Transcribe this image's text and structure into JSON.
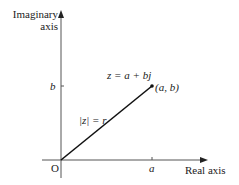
{
  "diagram": {
    "y_axis_label_line1": "Imaginary",
    "y_axis_label_line2": "axis",
    "x_axis_label": "Real axis",
    "origin_label": "O",
    "x_tick_label": "a",
    "y_tick_label": "b",
    "equation_label": "z = a + bj",
    "point_label": "(a, b)",
    "modulus_label": "|z| = r",
    "colors": {
      "axis": "#555555",
      "vector": "#111111",
      "text": "#222222"
    }
  }
}
